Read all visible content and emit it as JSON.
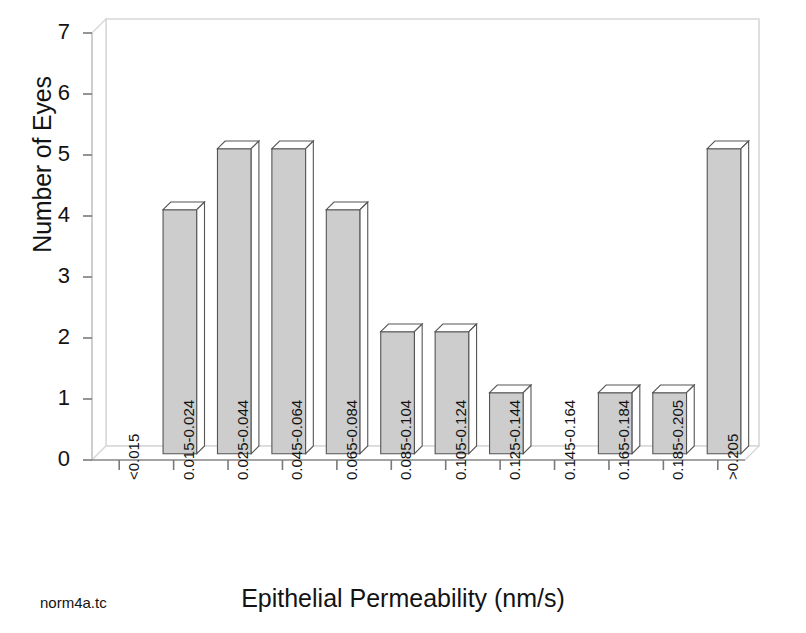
{
  "caption": "norm4a.tc",
  "chart_data": {
    "type": "bar",
    "title": "",
    "subtitle": "",
    "xlabel": "Epithelial Permeability (nm/s)",
    "ylabel": "Number of Eyes",
    "categories": [
      "<0.015",
      "0.015-0.024",
      "0.025-0.044",
      "0.045-0.064",
      "0.065-0.084",
      "0.085-0.104",
      "0.105-0.124",
      "0.125-0.144",
      "0.145-0.164",
      "0.165-0.184",
      "0.185-0.205",
      ">0.205"
    ],
    "values": [
      0,
      4,
      5,
      5,
      4,
      2,
      2,
      1,
      0,
      1,
      1,
      5
    ],
    "ylim": [
      0,
      7
    ],
    "yticks": [
      0,
      1,
      2,
      3,
      4,
      5,
      6,
      7
    ],
    "ytick_labels": [
      "0",
      "1",
      "2",
      "3",
      "4",
      "5",
      "6",
      "7"
    ],
    "grid": false,
    "legend": "none",
    "style": "3d-bar",
    "colors": {
      "bar_face": "#cdcdcd",
      "bar_top": "#ffffff",
      "bar_side": "#ffffff",
      "bar_outline": "#555555",
      "frame": "#d8d8d8",
      "axis_text": "#131313",
      "background": "#ffffff"
    }
  }
}
